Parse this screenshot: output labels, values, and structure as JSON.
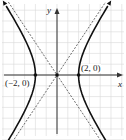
{
  "chart_data": {
    "type": "line",
    "title": "",
    "xlabel": "x",
    "ylabel": "y",
    "equation": "x^2/4 - y^2/9 = 1",
    "xlim": [
      -5,
      6
    ],
    "ylim": [
      -6,
      6
    ],
    "grid": true,
    "series": [
      {
        "name": "hyperbola-right-branch",
        "style": "solid",
        "x": [
          4.8,
          3.6,
          2.8,
          2.2,
          2,
          2.2,
          2.8,
          3.6,
          4.8
        ],
        "y": [
          -6.5,
          -4.5,
          -2.9,
          -1.4,
          0,
          1.4,
          2.9,
          4.5,
          6.5
        ]
      },
      {
        "name": "hyperbola-left-branch",
        "style": "solid",
        "x": [
          -4.8,
          -3.6,
          -2.8,
          -2.2,
          -2,
          -2.2,
          -2.8,
          -3.6,
          -4.8
        ],
        "y": [
          -6.5,
          -4.5,
          -2.9,
          -1.4,
          0,
          1.4,
          2.9,
          4.5,
          6.5
        ]
      },
      {
        "name": "asymptote-positive",
        "style": "dashed",
        "x": [
          -4.5,
          4.5
        ],
        "y": [
          -6.75,
          6.75
        ]
      },
      {
        "name": "asymptote-negative",
        "style": "dashed",
        "x": [
          -4.5,
          4.5
        ],
        "y": [
          6.75,
          -6.75
        ]
      }
    ],
    "points": [
      {
        "label": "(-2, 0)",
        "x": -2,
        "y": 0
      },
      {
        "label": "(2, 0)",
        "x": 2,
        "y": 0
      },
      {
        "label": "",
        "x": 0,
        "y": 0
      }
    ]
  },
  "labels": {
    "x_axis": "x",
    "y_axis": "y",
    "vertex_left": "(−2, 0)",
    "vertex_right": "(2, 0)"
  }
}
